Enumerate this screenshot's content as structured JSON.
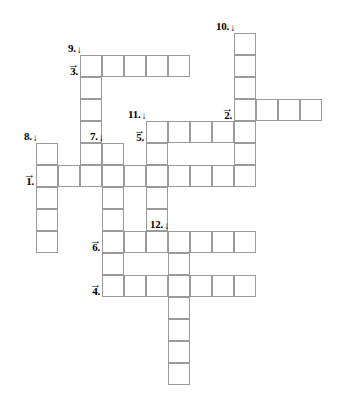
{
  "puzzle": {
    "title": "crossword-grid",
    "cell_size": 22,
    "origin": {
      "x": 36,
      "y": 33
    },
    "grid_line_color": "#9a9a9a",
    "cell_fill": "#ffffff",
    "background": "#ffffff",
    "arrow_across": "→",
    "arrow_down": "↓"
  },
  "entries": [
    {
      "number": "1.",
      "direction": "across",
      "row": 6,
      "col": 0,
      "length": 9,
      "label": "1."
    },
    {
      "number": "2.",
      "direction": "across",
      "row": 3,
      "col": 9,
      "length": 4,
      "label": "2."
    },
    {
      "number": "3.",
      "direction": "across",
      "row": 1,
      "col": 2,
      "length": 5,
      "label": "3."
    },
    {
      "number": "4.",
      "direction": "across",
      "row": 11,
      "col": 3,
      "length": 7,
      "label": "4."
    },
    {
      "number": "5.",
      "direction": "across",
      "row": 4,
      "col": 5,
      "length": 4,
      "label": "5."
    },
    {
      "number": "6.",
      "direction": "across",
      "row": 9,
      "col": 3,
      "length": 7,
      "label": "6."
    },
    {
      "number": "7.",
      "direction": "down",
      "row": 5,
      "col": 3,
      "length": 5,
      "label": "7."
    },
    {
      "number": "8.",
      "direction": "down",
      "row": 5,
      "col": 0,
      "length": 5,
      "label": "8."
    },
    {
      "number": "9.",
      "direction": "down",
      "row": 1,
      "col": 2,
      "length": 6,
      "label": "9."
    },
    {
      "number": "10.",
      "direction": "down",
      "row": 0,
      "col": 9,
      "length": 7,
      "label": "10."
    },
    {
      "number": "11.",
      "direction": "down",
      "row": 4,
      "col": 5,
      "length": 5,
      "label": "11."
    },
    {
      "number": "12.",
      "direction": "down",
      "row": 9,
      "col": 6,
      "length": 7,
      "label": "12."
    }
  ],
  "cells": [
    {
      "row": 0,
      "col": 9
    },
    {
      "row": 1,
      "col": 2
    },
    {
      "row": 1,
      "col": 3
    },
    {
      "row": 1,
      "col": 4
    },
    {
      "row": 1,
      "col": 5
    },
    {
      "row": 1,
      "col": 6
    },
    {
      "row": 1,
      "col": 9
    },
    {
      "row": 2,
      "col": 2
    },
    {
      "row": 2,
      "col": 9
    },
    {
      "row": 3,
      "col": 2
    },
    {
      "row": 3,
      "col": 9
    },
    {
      "row": 3,
      "col": 10
    },
    {
      "row": 3,
      "col": 11
    },
    {
      "row": 3,
      "col": 12
    },
    {
      "row": 4,
      "col": 2
    },
    {
      "row": 4,
      "col": 5
    },
    {
      "row": 4,
      "col": 6
    },
    {
      "row": 4,
      "col": 7
    },
    {
      "row": 4,
      "col": 8
    },
    {
      "row": 4,
      "col": 9
    },
    {
      "row": 5,
      "col": 0
    },
    {
      "row": 5,
      "col": 2
    },
    {
      "row": 5,
      "col": 3
    },
    {
      "row": 5,
      "col": 5
    },
    {
      "row": 5,
      "col": 9
    },
    {
      "row": 6,
      "col": 0
    },
    {
      "row": 6,
      "col": 1
    },
    {
      "row": 6,
      "col": 2
    },
    {
      "row": 6,
      "col": 3
    },
    {
      "row": 6,
      "col": 4
    },
    {
      "row": 6,
      "col": 5
    },
    {
      "row": 6,
      "col": 6
    },
    {
      "row": 6,
      "col": 7
    },
    {
      "row": 6,
      "col": 8
    },
    {
      "row": 6,
      "col": 9
    },
    {
      "row": 7,
      "col": 0
    },
    {
      "row": 7,
      "col": 3
    },
    {
      "row": 7,
      "col": 5
    },
    {
      "row": 8,
      "col": 0
    },
    {
      "row": 8,
      "col": 3
    },
    {
      "row": 8,
      "col": 5
    },
    {
      "row": 9,
      "col": 0
    },
    {
      "row": 9,
      "col": 3
    },
    {
      "row": 9,
      "col": 4
    },
    {
      "row": 9,
      "col": 5
    },
    {
      "row": 9,
      "col": 6
    },
    {
      "row": 9,
      "col": 7
    },
    {
      "row": 9,
      "col": 8
    },
    {
      "row": 9,
      "col": 9
    },
    {
      "row": 10,
      "col": 3
    },
    {
      "row": 10,
      "col": 6
    },
    {
      "row": 11,
      "col": 3
    },
    {
      "row": 11,
      "col": 4
    },
    {
      "row": 11,
      "col": 5
    },
    {
      "row": 11,
      "col": 6
    },
    {
      "row": 11,
      "col": 7
    },
    {
      "row": 11,
      "col": 8
    },
    {
      "row": 11,
      "col": 9
    },
    {
      "row": 12,
      "col": 6
    },
    {
      "row": 13,
      "col": 6
    },
    {
      "row": 14,
      "col": 6
    },
    {
      "row": 15,
      "col": 6
    }
  ]
}
